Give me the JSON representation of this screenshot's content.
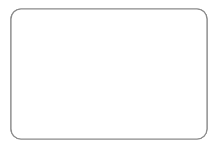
{
  "canvas": {
    "width": 222,
    "height": 147,
    "background": "#ffffff"
  },
  "frame": {
    "label": "rounded-rectangle-container",
    "x": 11,
    "y": 9,
    "width": 196,
    "height": 130,
    "corner_radius": 10,
    "stroke": "#8a8a8a",
    "stroke_width": 1.2,
    "fill": "#ffffff"
  },
  "style": {
    "disc_fill": "#d8d8d8",
    "disc_stroke": "#6f6f6f",
    "disc_stroke_width": 1,
    "disc_radius": 9
  },
  "counts": {
    "total_discs": 12,
    "overlapping_pairs": 2,
    "clipped_by_border": 1
  },
  "chart_data": {
    "type": "scatter",
    "title": "",
    "xlabel": "",
    "ylabel": "",
    "xlim": [
      0,
      222
    ],
    "ylim": [
      0,
      147
    ],
    "grid": false,
    "legend": "none",
    "marker": "circle",
    "marker_radius": 9,
    "series": [
      {
        "name": "discs",
        "points": [
          {
            "id": "disc-1",
            "cx": 43,
            "cy": 22,
            "r": 9,
            "z": 1,
            "clipped": false,
            "group": "single-top-left"
          },
          {
            "id": "disc-2",
            "cx": 53,
            "cy": 50,
            "r": 9,
            "z": 2,
            "clipped": false,
            "group": "pair-left-back"
          },
          {
            "id": "disc-3",
            "cx": 63,
            "cy": 56,
            "r": 9,
            "z": 3,
            "clipped": false,
            "group": "pair-left-front"
          },
          {
            "id": "disc-4",
            "cx": 150,
            "cy": 44,
            "r": 9,
            "z": 1,
            "clipped": false,
            "group": "single-top-right-inner"
          },
          {
            "id": "disc-5",
            "cx": 188,
            "cy": 43,
            "r": 9,
            "z": 1,
            "clipped": false,
            "group": "single-top-right-outer"
          },
          {
            "id": "disc-6",
            "cx": 167,
            "cy": 77,
            "r": 9,
            "z": 2,
            "clipped": false,
            "group": "pair-right-back"
          },
          {
            "id": "disc-7",
            "cx": 160,
            "cy": 89,
            "r": 9,
            "z": 3,
            "clipped": false,
            "group": "pair-right-front"
          },
          {
            "id": "disc-8",
            "cx": 209,
            "cy": 90,
            "r": 9,
            "z": 1,
            "clipped": true,
            "group": "edge-clipped-right"
          },
          {
            "id": "disc-9",
            "cx": 113,
            "cy": 97,
            "r": 9,
            "z": 1,
            "clipped": false,
            "group": "single-center-bottom"
          },
          {
            "id": "disc-10",
            "cx": 40,
            "cy": 122,
            "r": 9,
            "z": 1,
            "clipped": false,
            "group": "single-bottom-left"
          },
          {
            "id": "disc-11",
            "cx": 185,
            "cy": 121,
            "r": 9,
            "z": 1,
            "clipped": false,
            "group": "single-bottom-right"
          },
          {
            "id": "disc-12",
            "cx": 168,
            "cy": 72,
            "r": 9,
            "z": 2,
            "clipped": false,
            "group": "pair-right-back-dup"
          }
        ]
      }
    ]
  }
}
